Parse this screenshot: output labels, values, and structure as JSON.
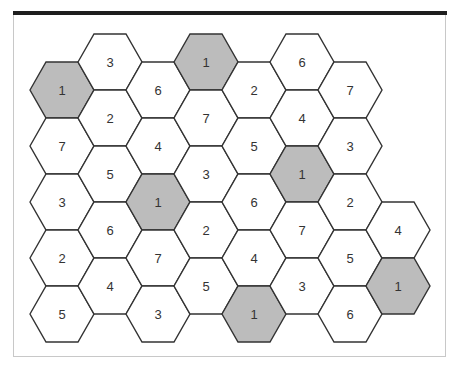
{
  "diagram": {
    "type": "hexagonal-number-grid",
    "colors": {
      "cell_fill": "#ffffff",
      "shaded_fill": "#bcbcbc",
      "stroke": "#333333",
      "top_rule": "#1e1e1e",
      "frame": "#c8c8c8"
    },
    "cells": [
      {
        "col": 0,
        "x": 62,
        "y": 90,
        "value": "1",
        "shaded": true
      },
      {
        "col": 0,
        "x": 62,
        "y": 146,
        "value": "7",
        "shaded": false
      },
      {
        "col": 0,
        "x": 62,
        "y": 202,
        "value": "3",
        "shaded": false
      },
      {
        "col": 0,
        "x": 62,
        "y": 258,
        "value": "2",
        "shaded": false
      },
      {
        "col": 0,
        "x": 62,
        "y": 314,
        "value": "5",
        "shaded": false
      },
      {
        "col": 1,
        "x": 110,
        "y": 62,
        "value": "3",
        "shaded": false
      },
      {
        "col": 1,
        "x": 110,
        "y": 118,
        "value": "2",
        "shaded": false
      },
      {
        "col": 1,
        "x": 110,
        "y": 174,
        "value": "5",
        "shaded": false
      },
      {
        "col": 1,
        "x": 110,
        "y": 230,
        "value": "6",
        "shaded": false
      },
      {
        "col": 1,
        "x": 110,
        "y": 286,
        "value": "4",
        "shaded": false
      },
      {
        "col": 2,
        "x": 158,
        "y": 90,
        "value": "6",
        "shaded": false
      },
      {
        "col": 2,
        "x": 158,
        "y": 146,
        "value": "4",
        "shaded": false
      },
      {
        "col": 2,
        "x": 158,
        "y": 202,
        "value": "1",
        "shaded": true
      },
      {
        "col": 2,
        "x": 158,
        "y": 258,
        "value": "7",
        "shaded": false
      },
      {
        "col": 2,
        "x": 158,
        "y": 314,
        "value": "3",
        "shaded": false
      },
      {
        "col": 3,
        "x": 206,
        "y": 62,
        "value": "1",
        "shaded": true
      },
      {
        "col": 3,
        "x": 206,
        "y": 118,
        "value": "7",
        "shaded": false
      },
      {
        "col": 3,
        "x": 206,
        "y": 174,
        "value": "3",
        "shaded": false
      },
      {
        "col": 3,
        "x": 206,
        "y": 230,
        "value": "2",
        "shaded": false
      },
      {
        "col": 3,
        "x": 206,
        "y": 286,
        "value": "5",
        "shaded": false
      },
      {
        "col": 4,
        "x": 254,
        "y": 90,
        "value": "2",
        "shaded": false
      },
      {
        "col": 4,
        "x": 254,
        "y": 146,
        "value": "5",
        "shaded": false
      },
      {
        "col": 4,
        "x": 254,
        "y": 202,
        "value": "6",
        "shaded": false
      },
      {
        "col": 4,
        "x": 254,
        "y": 258,
        "value": "4",
        "shaded": false
      },
      {
        "col": 4,
        "x": 254,
        "y": 314,
        "value": "1",
        "shaded": true
      },
      {
        "col": 5,
        "x": 302,
        "y": 62,
        "value": "6",
        "shaded": false
      },
      {
        "col": 5,
        "x": 302,
        "y": 118,
        "value": "4",
        "shaded": false
      },
      {
        "col": 5,
        "x": 302,
        "y": 174,
        "value": "1",
        "shaded": true
      },
      {
        "col": 5,
        "x": 302,
        "y": 230,
        "value": "7",
        "shaded": false
      },
      {
        "col": 5,
        "x": 302,
        "y": 286,
        "value": "3",
        "shaded": false
      },
      {
        "col": 6,
        "x": 350,
        "y": 90,
        "value": "7",
        "shaded": false
      },
      {
        "col": 6,
        "x": 350,
        "y": 146,
        "value": "3",
        "shaded": false
      },
      {
        "col": 6,
        "x": 350,
        "y": 202,
        "value": "2",
        "shaded": false
      },
      {
        "col": 6,
        "x": 350,
        "y": 258,
        "value": "5",
        "shaded": false
      },
      {
        "col": 6,
        "x": 350,
        "y": 314,
        "value": "6",
        "shaded": false
      },
      {
        "col": 7,
        "x": 398,
        "y": 230,
        "value": "4",
        "shaded": false
      },
      {
        "col": 7,
        "x": 398,
        "y": 286,
        "value": "1",
        "shaded": true
      }
    ]
  }
}
